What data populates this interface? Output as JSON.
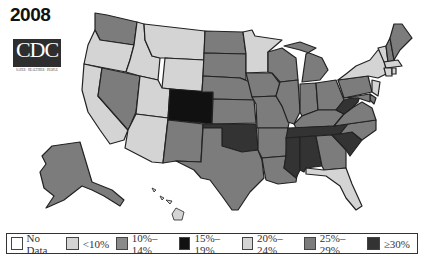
{
  "title": {
    "year": "2008",
    "logo_text": "CDC",
    "logo_subtext": "SAFER · HEALTHIER · PEOPLE"
  },
  "colors": {
    "no_data": "#ffffff",
    "lt10": "#d4d4d4",
    "p10_14": "#8a8a8a",
    "p15_19": "#111111",
    "p20_24": "#d4d4d4",
    "p25_29": "#7c7c7c",
    "ge30": "#333333",
    "border": "#222222"
  },
  "legend": {
    "items": [
      {
        "label": "No Data",
        "color": "#ffffff"
      },
      {
        "label": "<10%",
        "color": "#d4d4d4"
      },
      {
        "label": "10%–14%",
        "color": "#8a8a8a"
      },
      {
        "label": "15%–19%",
        "color": "#111111"
      },
      {
        "label": "20%–24%",
        "color": "#d4d4d4"
      },
      {
        "label": "25%–29%",
        "color": "#7c7c7c"
      },
      {
        "label": "≥30%",
        "color": "#333333"
      }
    ]
  },
  "map_data": {
    "type": "choropleth",
    "region": "United States",
    "year": "2008",
    "categories": [
      "No Data",
      "<10%",
      "10%–14%",
      "15%–19%",
      "20%–24%",
      "25%–29%",
      "≥30%"
    ],
    "states": {
      "WA": "25%–29%",
      "OR": "20%–24%",
      "CA": "20%–24%",
      "NV": "25%–29%",
      "ID": "20%–24%",
      "MT": "20%–24%",
      "WY": "20%–24%",
      "UT": "20%–24%",
      "AZ": "20%–24%",
      "CO": "15%–19%",
      "NM": "25%–29%",
      "ND": "25%–29%",
      "SD": "25%–29%",
      "NE": "25%–29%",
      "KS": "25%–29%",
      "OK": "≥30%",
      "TX": "25%–29%",
      "MN": "20%–24%",
      "IA": "25%–29%",
      "MO": "25%–29%",
      "AR": "25%–29%",
      "LA": "25%–29%",
      "WI": "25%–29%",
      "IL": "25%–29%",
      "MI": "25%–29%",
      "IN": "25%–29%",
      "OH": "25%–29%",
      "KY": "25%–29%",
      "TN": "≥30%",
      "MS": "≥30%",
      "AL": "≥30%",
      "GA": "25%–29%",
      "FL": "20%–24%",
      "SC": "≥30%",
      "NC": "25%–29%",
      "VA": "25%–29%",
      "WV": "≥30%",
      "PA": "25%–29%",
      "NY": "20%–24%",
      "VT": "20%–24%",
      "NH": "25%–29%",
      "ME": "25%–29%",
      "MA": "20%–24%",
      "CT": "20%–24%",
      "RI": "20%–24%",
      "NJ": "20%–24%",
      "DE": "25%–29%",
      "MD": "25%–29%",
      "AK": "25%–29%",
      "HI": "20%–24%"
    }
  }
}
